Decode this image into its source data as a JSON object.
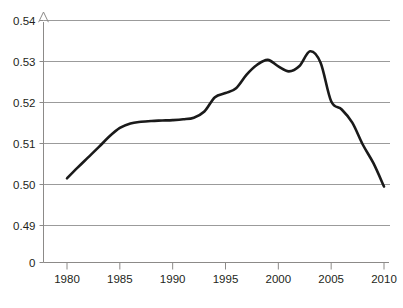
{
  "chart_data": {
    "type": "line",
    "title": "",
    "subtitle": "",
    "xlabel": "",
    "ylabel": "",
    "grid": true,
    "legend": null,
    "xlim": [
      1978.2,
      2012.2
    ],
    "ylim_plot": [
      0.4845,
      0.5405
    ],
    "yticks": [
      "0.54",
      "0.53",
      "0.52",
      "0.51",
      "0.50",
      "0.49",
      "0"
    ],
    "ytick_values": [
      0.54,
      0.53,
      0.52,
      0.51,
      0.5,
      0.49,
      0
    ],
    "xticks": [
      "1980",
      "1985",
      "1990",
      "1995",
      "2000",
      "2005",
      "2010"
    ],
    "xtick_values": [
      1980,
      1985,
      1990,
      1995,
      2000,
      2005,
      2010
    ],
    "axis_note": "y-axis has a break: 0 baseline sits below the 0.49 gridline",
    "line_color": "#1a1a1a",
    "line_width": 2.6,
    "grid_color": "#9b9b9b",
    "axis_color": "#8c8a88",
    "x": [
      1980,
      1981,
      1982,
      1983,
      1984,
      1985,
      1986,
      1987,
      1988,
      1989,
      1990,
      1991,
      1992,
      1993,
      1994,
      1995,
      1996,
      1997,
      1998,
      1999,
      2000,
      2001,
      2002,
      2003,
      2004,
      2005,
      2006,
      2007,
      2008,
      2009,
      2010
    ],
    "values": [
      0.5015,
      0.5041,
      0.5066,
      0.5091,
      0.5117,
      0.5138,
      0.5149,
      0.5153,
      0.5155,
      0.5156,
      0.5157,
      0.5159,
      0.5163,
      0.5178,
      0.5213,
      0.5223,
      0.5235,
      0.5268,
      0.5292,
      0.5304,
      0.5288,
      0.5276,
      0.5289,
      0.5325,
      0.5297,
      0.5203,
      0.5183,
      0.5151,
      0.5097,
      0.5052,
      0.4995
    ],
    "series": [
      {
        "name": "series-1",
        "values": [
          0.5015,
          0.5041,
          0.5066,
          0.5091,
          0.5117,
          0.5138,
          0.5149,
          0.5153,
          0.5155,
          0.5156,
          0.5157,
          0.5159,
          0.5163,
          0.5178,
          0.5213,
          0.5223,
          0.5235,
          0.5268,
          0.5292,
          0.5304,
          0.5288,
          0.5276,
          0.5289,
          0.5325,
          0.5297,
          0.5203,
          0.5183,
          0.5151,
          0.5097,
          0.5052,
          0.4995
        ]
      }
    ]
  },
  "caption": {
    "text": ""
  }
}
